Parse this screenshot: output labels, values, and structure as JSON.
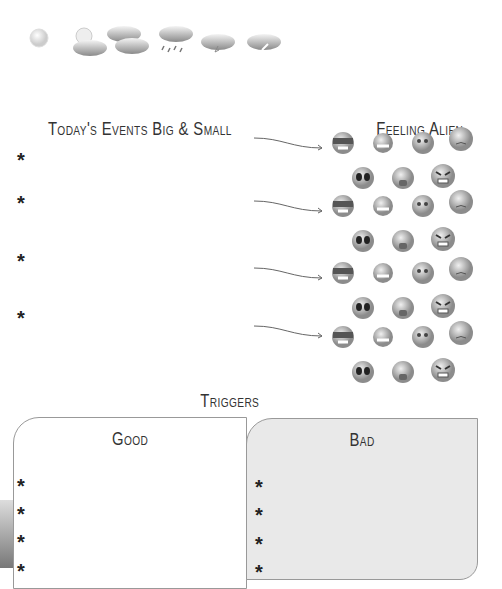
{
  "weather": {
    "icons": [
      {
        "name": "sun-icon"
      },
      {
        "name": "partly-cloudy-icon"
      },
      {
        "name": "cloudy-icon"
      },
      {
        "name": "rain-icon"
      },
      {
        "name": "storm-icon"
      },
      {
        "name": "wind-icon"
      }
    ]
  },
  "events": {
    "title": "Today's Events Big & Small",
    "bullets": [
      "*",
      "*",
      "*",
      "*"
    ]
  },
  "feelings": {
    "title": "Feeling Alien",
    "groups": 4,
    "faces": [
      "cool",
      "laughing",
      "worried",
      "sad",
      "scared",
      "crying",
      "angry"
    ]
  },
  "triggers": {
    "title": "Triggers",
    "good": {
      "title": "Good",
      "bullets": [
        "*",
        "*",
        "*",
        "*"
      ]
    },
    "bad": {
      "title": "Bad",
      "bullets": [
        "*",
        "*",
        "*",
        "*"
      ]
    }
  }
}
